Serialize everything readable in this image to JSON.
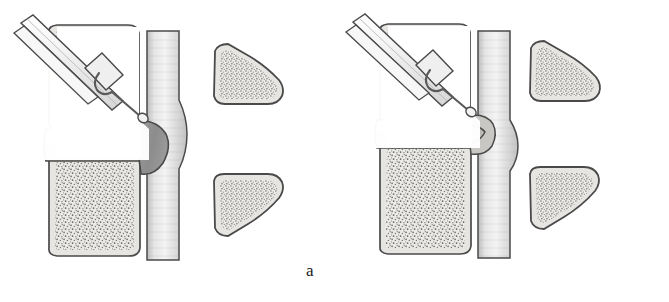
{
  "figure": {
    "background_color": "#ffffff",
    "width": 669,
    "height": 302,
    "panel_count": 2
  },
  "palette": {
    "outline": "#4a4a4a",
    "outline_dark": "#3a3a3a",
    "cortical_bone": "#e7e5e1",
    "cancellous_stipple": "#6e6e6e",
    "disc_body": "#dedbd6",
    "nucleus_pulposus": "#b6b4b0",
    "herniation_dark": "#8e8e8e",
    "spinal_cord": "#d9d9d9",
    "cord_highlight": "#f2f2f2",
    "cannula_fill": "#efefef",
    "needle_wire": "#7a7a7a",
    "white_corridor": "#ffffff",
    "caption_text": "#1a1a1a"
  },
  "panels": [
    {
      "id": "a",
      "caption": "a",
      "stage": "pre-decompression",
      "description": "Herniated nucleus pulposus protrudes posteriorly and indents the spinal cord; cannula with inner probe inserted through the vertebral body into the disc.",
      "parts": {
        "upper_vertebral_body": "upper-vertebral-body",
        "lower_vertebral_body": "lower-vertebral-body",
        "intervertebral_disc": "intervertebral-disc",
        "nucleus_pulposus": "nucleus-pulposus-lens",
        "herniation": "posterior-disc-herniation",
        "spinal_cord": "spinal-cord",
        "upper_posterior_element": "upper-spinous-process",
        "lower_posterior_element": "lower-spinous-process",
        "cannula": "introducer-cannula",
        "probe": "decompression-probe"
      }
    },
    {
      "id": "b",
      "caption": "b",
      "stage": "post-decompression",
      "description": "After decompression the nucleus is drawn forward, the herniation is reduced and the spinal cord is no longer deformed.",
      "parts": {
        "upper_vertebral_body": "upper-vertebral-body",
        "lower_vertebral_body": "lower-vertebral-body",
        "intervertebral_disc": "intervertebral-disc",
        "nucleus_pulposus": "nucleus-pulposus-tapered",
        "herniation": "reduced-disc-bulge",
        "spinal_cord": "spinal-cord",
        "upper_posterior_element": "upper-spinous-process",
        "lower_posterior_element": "lower-spinous-process",
        "cannula": "introducer-cannula",
        "probe": "decompression-probe"
      }
    }
  ]
}
